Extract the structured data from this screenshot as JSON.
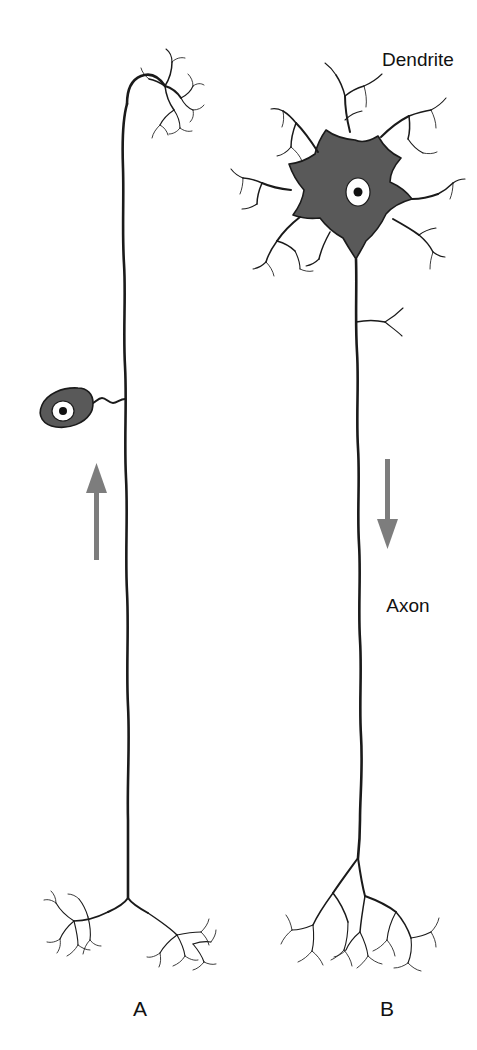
{
  "figure": {
    "background_color": "#ffffff",
    "ink_color": "#1a1a1a",
    "soma_fill_color": "#595959",
    "nucleus_color": "#ffffff",
    "nucleolus_color": "#111111",
    "arrow_color": "#7d7d7d"
  },
  "annotations": {
    "dendrite_label": "Dendrite",
    "axon_label": "Axon"
  },
  "panels": [
    {
      "id": "A",
      "label": "A",
      "neuron_type": "pseudounipolar sensory neuron",
      "soma_position": "lateral, offset from axon on a short stalk",
      "conduction_direction": "upward",
      "terminal_branches": 2
    },
    {
      "id": "B",
      "label": "B",
      "neuron_type": "multipolar motor neuron",
      "soma_position": "at top, in line with axon",
      "conduction_direction": "downward",
      "terminal_branches": 3
    }
  ]
}
